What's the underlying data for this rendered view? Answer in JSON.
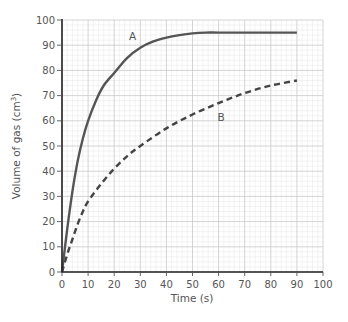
{
  "chart_data": {
    "type": "line",
    "title": "",
    "xlabel": "Time (s)",
    "ylabel": "Volume of gas (cm³)",
    "ylabel_base": "Volume of gas (cm",
    "ylabel_sup": "3",
    "ylabel_end": ")",
    "xlim": [
      0,
      100
    ],
    "ylim": [
      0,
      100
    ],
    "xticks": [
      0,
      10,
      20,
      30,
      40,
      50,
      60,
      70,
      80,
      90,
      100
    ],
    "yticks": [
      0,
      10,
      20,
      30,
      40,
      50,
      60,
      70,
      80,
      90,
      100
    ],
    "grid": true,
    "minor_grid_step": 2,
    "series": [
      {
        "name": "A",
        "style": "solid",
        "color": "#555555",
        "x": [
          0,
          2,
          4,
          6,
          8,
          10,
          13,
          16,
          20,
          25,
          30,
          35,
          40,
          45,
          50,
          55,
          60,
          70,
          80,
          90
        ],
        "y": [
          0,
          17,
          32,
          44,
          53,
          60,
          68,
          74,
          79,
          85,
          89,
          91.5,
          93,
          94,
          94.7,
          95,
          95,
          95,
          95,
          95
        ],
        "label_pos": [
          27,
          92
        ]
      },
      {
        "name": "B",
        "style": "dashed",
        "color": "#444444",
        "x": [
          0,
          2,
          4,
          6,
          8,
          10,
          15,
          20,
          25,
          30,
          40,
          50,
          60,
          70,
          80,
          90
        ],
        "y": [
          0,
          7,
          13,
          19,
          24,
          28,
          35,
          41,
          46,
          50,
          57,
          62.5,
          67,
          71,
          74,
          76
        ],
        "label_pos": [
          61,
          60
        ]
      }
    ]
  }
}
